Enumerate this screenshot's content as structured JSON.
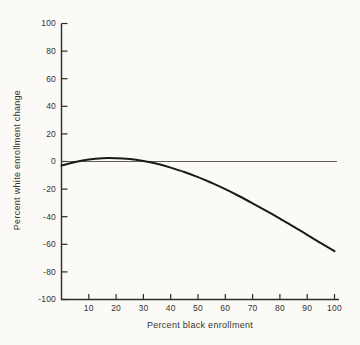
{
  "chart_data": {
    "type": "line",
    "title": "",
    "xlabel": "Percent black enrollment",
    "ylabel": "Percent white enrollment change",
    "xlim": [
      0,
      100
    ],
    "ylim": [
      -100,
      100
    ],
    "x_ticks": [
      10,
      20,
      30,
      40,
      50,
      60,
      70,
      80,
      90,
      100
    ],
    "y_ticks": [
      100,
      80,
      60,
      40,
      20,
      0,
      -20,
      -40,
      -60,
      -80,
      -100
    ],
    "grid": false,
    "legend": "none",
    "reference_line_y": 0,
    "series": [
      {
        "name": "predicted white enrollment change",
        "x": [
          0,
          5,
          10,
          15,
          20,
          25,
          30,
          35,
          40,
          45,
          50,
          55,
          60,
          65,
          70,
          75,
          80,
          85,
          90,
          95,
          100
        ],
        "y": [
          -3.0,
          -0.3,
          1.5,
          2.4,
          2.4,
          1.8,
          0.4,
          -1.7,
          -4.4,
          -7.6,
          -11.3,
          -15.5,
          -20.1,
          -25.0,
          -30.3,
          -35.7,
          -41.4,
          -47.2,
          -53.1,
          -59.1,
          -65.0
        ],
        "color": "#1b1a18"
      }
    ]
  },
  "colors": {
    "background": "#fbfaf7",
    "axis": "#2e2c29",
    "text": "#35332f",
    "reference_line": "#504d48"
  }
}
